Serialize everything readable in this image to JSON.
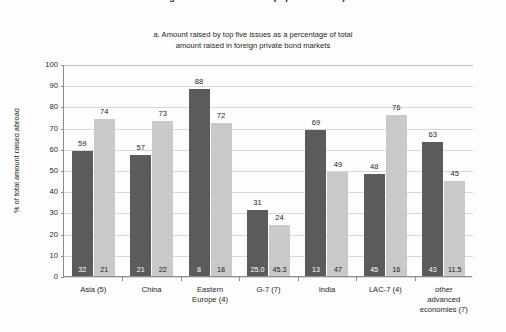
{
  "heading_clipped": "Figure 3. Bond issuance (top five issues)",
  "subtitle": {
    "line1": "a. Amount raised by top five issues as a percentage of total",
    "line2": "amount raised in foreign private bond markets"
  },
  "axes": {
    "ylabel": "% of total amount raised abroad",
    "yticks": [
      "0",
      "10",
      "20",
      "30",
      "40",
      "50",
      "60",
      "70",
      "80",
      "90",
      "100"
    ],
    "ymin": 0,
    "ymax": 100
  },
  "colors": {
    "dark_bar": "#5b5b5b",
    "light_bar": "#c9c9c9",
    "grid": "#d8d8d8",
    "axis": "#8c8c8c",
    "background": "#fdfdfd",
    "text": "#1f1f1f"
  },
  "chart_data": {
    "type": "bar",
    "title": "a. Amount raised by top five issues as a percentage of total amount raised in foreign private bond markets",
    "xlabel": "",
    "ylabel": "% of total amount raised abroad",
    "ylim": [
      0,
      100
    ],
    "grid": true,
    "legend": "none",
    "categories": [
      "Asia (5)",
      "China",
      "Eastern Europe (4)",
      "G-7 (7)",
      "India",
      "LAC-7 (4)",
      "other advanced economies (7)"
    ],
    "series": [
      {
        "name": "dark",
        "values": [
          59,
          57,
          88,
          31,
          69,
          48,
          63
        ],
        "base_labels": [
          "32",
          "21",
          "8",
          "25.0",
          "13",
          "45",
          "43"
        ]
      },
      {
        "name": "light",
        "values": [
          74,
          73,
          72,
          24,
          49,
          76,
          45
        ],
        "base_labels": [
          "21",
          "22",
          "18",
          "45.3",
          "47",
          "16",
          "11.5"
        ]
      }
    ]
  },
  "category_label_lines": [
    [
      "Asia (5)"
    ],
    [
      "China"
    ],
    [
      "Eastern",
      "Europe (4)"
    ],
    [
      "G-7 (7)"
    ],
    [
      "India"
    ],
    [
      "LAC-7 (4)"
    ],
    [
      "other",
      "advanced",
      "economies (7)"
    ]
  ]
}
